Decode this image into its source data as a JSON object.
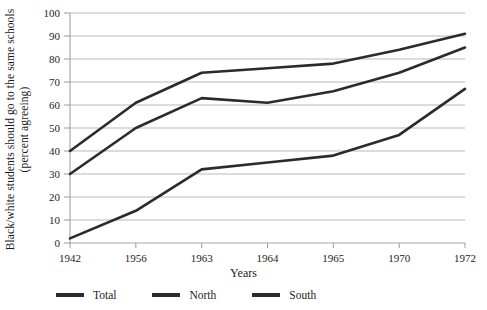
{
  "chart_data": {
    "type": "line",
    "title": "",
    "xlabel": "Years",
    "ylabel": "Black/white students should go to the same schools (percent agreeing)",
    "categories": [
      "1942",
      "1956",
      "1963",
      "1964",
      "1965",
      "1970",
      "1972"
    ],
    "ylim": [
      0,
      100
    ],
    "yticks": [
      0,
      10,
      20,
      30,
      40,
      50,
      60,
      70,
      80,
      90,
      100
    ],
    "grid": "horizontal",
    "legend_position": "bottom-left",
    "series": [
      {
        "name": "Total",
        "values": [
          30,
          50,
          63,
          61,
          66,
          74,
          85
        ],
        "color": "#2b2b2b"
      },
      {
        "name": "North",
        "values": [
          40,
          61,
          74,
          76,
          78,
          84,
          91
        ],
        "color": "#2b2b2b"
      },
      {
        "name": "South",
        "values": [
          2,
          14,
          32,
          35,
          38,
          47,
          67
        ],
        "color": "#2b2b2b"
      }
    ]
  },
  "axis": {
    "y_title": "Black/white students should go to the same schools (percent agreeing)",
    "x_title": "Years",
    "y_labels": [
      "100",
      "90",
      "80",
      "70",
      "60",
      "50",
      "40",
      "30",
      "20",
      "10",
      "0"
    ],
    "x_labels": [
      "1942",
      "1956",
      "1963",
      "1964",
      "1965",
      "1970",
      "1972"
    ]
  },
  "legend": {
    "items": [
      {
        "label": "Total"
      },
      {
        "label": "North"
      },
      {
        "label": "South"
      }
    ]
  }
}
